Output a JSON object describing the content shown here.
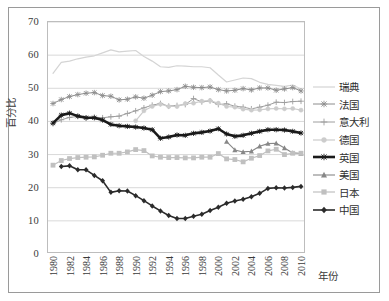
{
  "chart_data": {
    "type": "line",
    "title": "",
    "xlabel": "年份",
    "ylabel": "百分比",
    "xlim": [
      1980,
      2010
    ],
    "ylim": [
      0,
      70
    ],
    "yticks": [
      0,
      10,
      20,
      30,
      40,
      50,
      60,
      70
    ],
    "xticks": [
      1980,
      1982,
      1984,
      1986,
      1988,
      1990,
      1992,
      1994,
      1996,
      1998,
      2000,
      2002,
      2004,
      2006,
      2008,
      2010
    ],
    "grid": "horizontal",
    "legend_position": "right",
    "x": [
      1980,
      1981,
      1982,
      1983,
      1984,
      1985,
      1986,
      1987,
      1988,
      1989,
      1990,
      1991,
      1992,
      1993,
      1994,
      1995,
      1996,
      1997,
      1998,
      1999,
      2000,
      2001,
      2002,
      2003,
      2004,
      2005,
      2006,
      2007,
      2008,
      2009,
      2010
    ],
    "series": [
      {
        "name": "瑞典",
        "color": "#d4d4d4",
        "marker": "none",
        "width": 1.2,
        "values": [
          54.5,
          57.8,
          58.2,
          58.9,
          59.4,
          59.8,
          60.7,
          61.6,
          61.0,
          61.2,
          61.4,
          59.6,
          58.2,
          56.5,
          56.3,
          56.8,
          56.7,
          56.5,
          56.5,
          56.2,
          54.0,
          51.9,
          52.5,
          53.1,
          52.9,
          51.8,
          51.2,
          50.9,
          50.6,
          51.0,
          49.8
        ]
      },
      {
        "name": "法国",
        "color": "#8c8c8c",
        "marker": "star",
        "width": 1.0,
        "values": [
          45.4,
          46.6,
          47.5,
          48.1,
          48.5,
          48.7,
          47.8,
          47.6,
          46.5,
          46.7,
          47.4,
          47.0,
          47.9,
          49.0,
          49.2,
          49.6,
          50.6,
          50.3,
          50.2,
          50.4,
          49.6,
          49.2,
          49.4,
          49.9,
          49.5,
          50.1,
          50.1,
          49.4,
          49.8,
          50.2,
          49.2
        ]
      },
      {
        "name": "意大利",
        "color": "#9e9e9e",
        "marker": "plus",
        "width": 1.0,
        "values": [
          39.3,
          40.5,
          41.2,
          41.5,
          41.0,
          41.3,
          41.1,
          41.4,
          41.6,
          42.4,
          43.2,
          44.1,
          44.9,
          45.4,
          44.6,
          44.8,
          45.1,
          46.9,
          45.9,
          46.2,
          45.1,
          45.3,
          44.6,
          44.3,
          43.8,
          44.3,
          44.9,
          45.8,
          45.7,
          46.0,
          46.1
        ]
      },
      {
        "name": "德国",
        "color": "#cccccc",
        "marker": "circle",
        "width": 1.2,
        "values": [
          null,
          null,
          null,
          null,
          null,
          null,
          null,
          null,
          null,
          null,
          40.2,
          43.2,
          44.5,
          45.2,
          44.5,
          44.5,
          45.4,
          45.5,
          46.1,
          46.3,
          45.5,
          44.5,
          44.3,
          43.7,
          43.4,
          43.5,
          43.8,
          43.9,
          43.8,
          43.9,
          43.4
        ]
      },
      {
        "name": "英国",
        "color": "#1a1a1a",
        "marker": "star",
        "width": 2.6,
        "values": [
          39.5,
          41.9,
          42.5,
          41.6,
          41.1,
          41.1,
          40.4,
          39.1,
          38.7,
          38.5,
          38.3,
          38.0,
          37.5,
          34.9,
          35.3,
          35.9,
          35.8,
          36.4,
          36.7,
          37.1,
          37.8,
          36.2,
          35.5,
          35.8,
          36.4,
          37.0,
          37.5,
          37.5,
          37.4,
          37.0,
          36.5
        ]
      },
      {
        "name": "美国",
        "color": "#878787",
        "marker": "triangle",
        "width": 1.1,
        "values": [
          null,
          null,
          null,
          null,
          null,
          null,
          null,
          null,
          null,
          null,
          null,
          null,
          null,
          null,
          null,
          null,
          null,
          null,
          null,
          null,
          null,
          33.9,
          31.4,
          30.8,
          31.0,
          32.5,
          33.3,
          33.4,
          32.0,
          30.5,
          30.3
        ]
      },
      {
        "name": "日本",
        "color": "#c0c0c0",
        "marker": "square",
        "width": 1.2,
        "values": [
          26.8,
          28.2,
          28.8,
          29.1,
          29.2,
          29.3,
          29.8,
          30.4,
          30.4,
          30.8,
          31.5,
          31.2,
          29.6,
          29.2,
          29.1,
          29.1,
          29.0,
          29.0,
          29.2,
          29.2,
          30.3,
          28.7,
          28.5,
          27.8,
          28.9,
          29.7,
          31.1,
          31.6,
          30.0,
          30.4,
          30.4
        ]
      },
      {
        "name": "中国",
        "color": "#2b2b2b",
        "marker": "diamond",
        "width": 1.6,
        "values": [
          null,
          26.4,
          26.6,
          25.4,
          25.4,
          23.7,
          22.1,
          18.6,
          19.1,
          19.0,
          17.6,
          16.1,
          14.5,
          13.0,
          11.6,
          10.7,
          10.7,
          11.4,
          12.0,
          13.1,
          14.1,
          15.3,
          16.0,
          16.5,
          17.3,
          18.3,
          19.8,
          20.0,
          19.9,
          20.1,
          20.4
        ]
      }
    ]
  },
  "axis": {
    "y_ticks": [
      "0",
      "10",
      "20",
      "30",
      "40",
      "50",
      "60",
      "70"
    ],
    "y_title": "百分比",
    "x_ticks": [
      "1980",
      "1982",
      "1984",
      "1986",
      "1988",
      "1990",
      "1992",
      "1994",
      "1996",
      "1998",
      "2000",
      "2002",
      "2004",
      "2006",
      "2008",
      "2010"
    ],
    "x_title": "年份"
  },
  "legend": {
    "items": [
      {
        "label": "瑞典",
        "icon": "line-plain-icon"
      },
      {
        "label": "法国",
        "icon": "line-star-marker-icon"
      },
      {
        "label": "意大利",
        "icon": "line-plus-marker-icon"
      },
      {
        "label": "德国",
        "icon": "line-circle-marker-icon"
      },
      {
        "label": "英国",
        "icon": "line-bold-star-marker-icon"
      },
      {
        "label": "美国",
        "icon": "line-triangle-marker-icon"
      },
      {
        "label": "日本",
        "icon": "line-square-marker-icon"
      },
      {
        "label": "中国",
        "icon": "line-diamond-marker-icon"
      }
    ]
  }
}
